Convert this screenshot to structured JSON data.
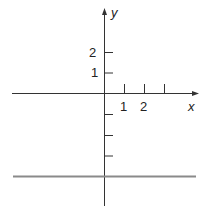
{
  "diagram": {
    "axes": {
      "x_label": "x",
      "y_label": "y",
      "x_tick_labels": [
        "1",
        "2"
      ],
      "y_tick_labels": [
        "2",
        "1"
      ],
      "x_ticks_count": 3,
      "y_negative_ticks_count": 3
    },
    "horizontal_line": {
      "description": "horizontal line below x-axis at y = -4",
      "y_value": -4,
      "color": "#8a8a8a"
    },
    "axis_color": "#333333"
  }
}
